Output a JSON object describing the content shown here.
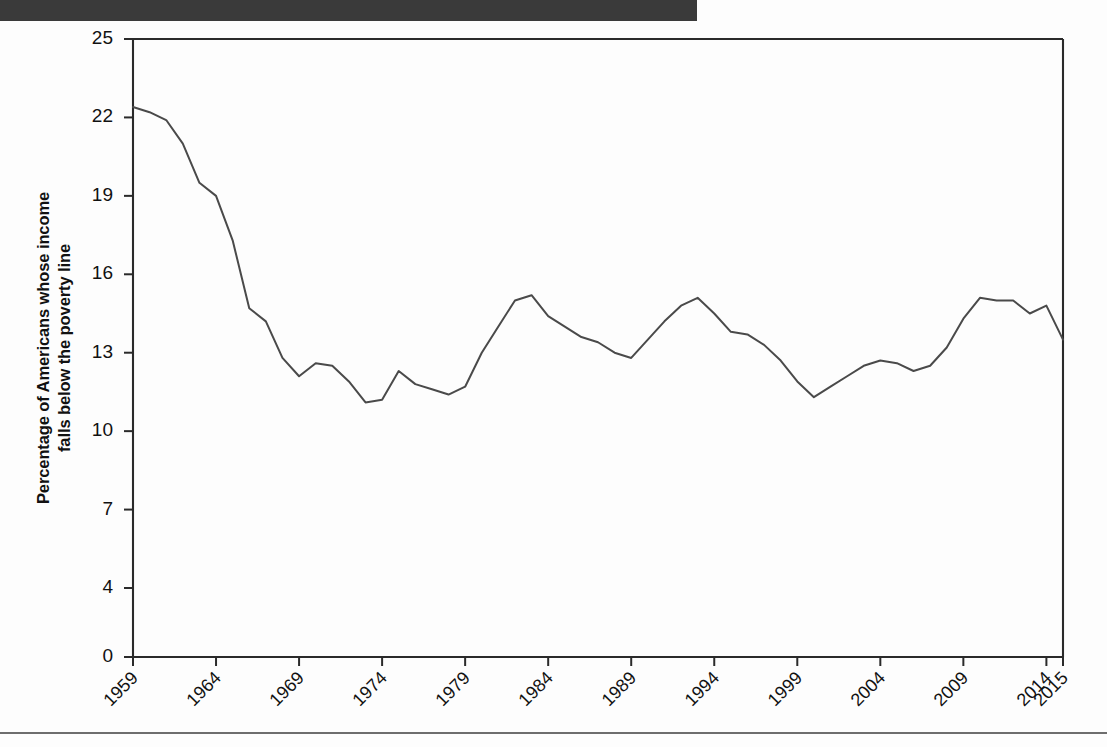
{
  "page": {
    "header_bar_color": "#3a3a3a",
    "background_color": "#fdfdfd",
    "rule_color": "#6e6e6e"
  },
  "chart_data": {
    "type": "line",
    "title": "",
    "xlabel": "",
    "ylabel": "Percentage of Americans whose income\nfalls below the poverty line",
    "ylabel_line1": "Percentage of Americans whose income",
    "ylabel_line2": "falls below the poverty line",
    "grid": false,
    "legend": "none",
    "line_color": "#4a4a4a",
    "axis_color": "#2a2a2a",
    "xlim": [
      1959,
      2015
    ],
    "ylim": [
      0,
      25
    ],
    "ytick_labels": [
      "25",
      "22",
      "19",
      "16",
      "13",
      "10",
      "7",
      "4",
      "0"
    ],
    "yticks": [
      25,
      22,
      19,
      16,
      13,
      10,
      7,
      4,
      0
    ],
    "xtick_labels": [
      "1959",
      "1964",
      "1969",
      "1974",
      "1979",
      "1984",
      "1989",
      "1994",
      "1999",
      "2004",
      "2009",
      "2014",
      "2015"
    ],
    "xticks": [
      1959,
      1964,
      1969,
      1974,
      1979,
      1984,
      1989,
      1994,
      1999,
      2004,
      2009,
      2014,
      2015
    ],
    "x": [
      1959,
      1960,
      1961,
      1962,
      1963,
      1964,
      1965,
      1966,
      1967,
      1968,
      1969,
      1970,
      1971,
      1972,
      1973,
      1974,
      1975,
      1976,
      1977,
      1978,
      1979,
      1980,
      1981,
      1982,
      1983,
      1984,
      1985,
      1986,
      1987,
      1988,
      1989,
      1990,
      1991,
      1992,
      1993,
      1994,
      1995,
      1996,
      1997,
      1998,
      1999,
      2000,
      2001,
      2002,
      2003,
      2004,
      2005,
      2006,
      2007,
      2008,
      2009,
      2010,
      2011,
      2012,
      2013,
      2014,
      2015
    ],
    "values": [
      22.4,
      22.2,
      21.9,
      21.0,
      19.5,
      19.0,
      17.3,
      14.7,
      14.2,
      12.8,
      12.1,
      12.6,
      12.5,
      11.9,
      11.1,
      11.2,
      12.3,
      11.8,
      11.6,
      11.4,
      11.7,
      13.0,
      14.0,
      15.0,
      15.2,
      14.4,
      14.0,
      13.6,
      13.4,
      13.0,
      12.8,
      13.5,
      14.2,
      14.8,
      15.1,
      14.5,
      13.8,
      13.7,
      13.3,
      12.7,
      11.9,
      11.3,
      11.7,
      12.1,
      12.5,
      12.7,
      12.6,
      12.3,
      12.5,
      13.2,
      14.3,
      15.1,
      15.0,
      15.0,
      14.5,
      14.8,
      13.5
    ],
    "series": [
      {
        "name": "Poverty rate",
        "values": [
          22.4,
          22.2,
          21.9,
          21.0,
          19.5,
          19.0,
          17.3,
          14.7,
          14.2,
          12.8,
          12.1,
          12.6,
          12.5,
          11.9,
          11.1,
          11.2,
          12.3,
          11.8,
          11.6,
          11.4,
          11.7,
          13.0,
          14.0,
          15.0,
          15.2,
          14.4,
          14.0,
          13.6,
          13.4,
          13.0,
          12.8,
          13.5,
          14.2,
          14.8,
          15.1,
          14.5,
          13.8,
          13.7,
          13.3,
          12.7,
          11.9,
          11.3,
          11.7,
          12.1,
          12.5,
          12.7,
          12.6,
          12.3,
          12.5,
          13.2,
          14.3,
          15.1,
          15.0,
          15.0,
          14.5,
          14.8,
          13.5
        ]
      }
    ]
  }
}
